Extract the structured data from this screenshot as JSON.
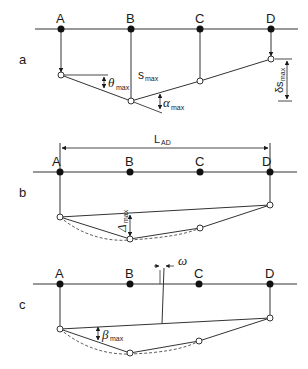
{
  "diagram": {
    "panels": [
      {
        "id": "a",
        "label": "a",
        "points": [
          "A",
          "B",
          "C",
          "D"
        ],
        "annotations": {
          "theta": {
            "symbol": "θ",
            "sub": "max"
          },
          "s": {
            "symbol": "s",
            "sub": "max"
          },
          "alpha": {
            "symbol": "α",
            "sub": "max"
          },
          "delta_s": {
            "symbol": "δs",
            "sub": "max"
          }
        }
      },
      {
        "id": "b",
        "label": "b",
        "points": [
          "A",
          "B",
          "C",
          "D"
        ],
        "annotations": {
          "length": {
            "symbol": "L",
            "sub": "AD"
          },
          "delta": {
            "symbol": "Δ",
            "sub": "max"
          }
        }
      },
      {
        "id": "c",
        "label": "c",
        "points": [
          "A",
          "B",
          "C",
          "D"
        ],
        "annotations": {
          "omega": {
            "symbol": "ω"
          },
          "beta": {
            "symbol": "β",
            "sub": "max"
          }
        }
      }
    ]
  }
}
